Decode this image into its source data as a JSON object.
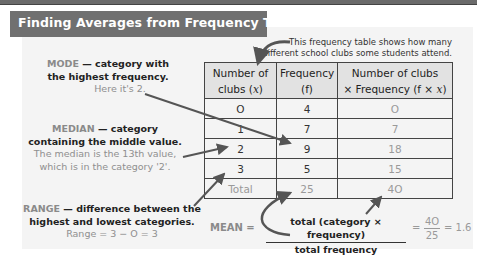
{
  "title": "Finding Averages from Frequency Tables",
  "note": {
    "line1": "This frequency table shows how many",
    "line2": "different school clubs some students attend."
  },
  "mode": {
    "keyword": "MODE",
    "definition_line1": " — category with",
    "definition_line2": "the highest frequency.",
    "example": "Here it's 2."
  },
  "median": {
    "keyword": "MEDIAN",
    "definition_line1": " — category",
    "definition_line2": "containing the middle value.",
    "example_line1": "The median is the 13th value,",
    "example_line2": "which is in the category '2'."
  },
  "range": {
    "keyword": "RANGE",
    "definition_line1": " — difference between the",
    "definition_line2": "highest and lowest categories.",
    "example": "Range = 3 − O = 3"
  },
  "table": {
    "headers": [
      {
        "line1": "Number of",
        "line2_pre": "clubs (",
        "var": "x",
        "line2_post": ")"
      },
      {
        "line1": "Frequency",
        "line2_pre": "(f)",
        "var": "",
        "line2_post": ""
      },
      {
        "line1": "Number of clubs",
        "line2_pre": "× Frequency (f × ",
        "var": "x",
        "line2_post": ")"
      }
    ],
    "rows": [
      [
        "O",
        "4",
        "O"
      ],
      [
        "1",
        "7",
        "7"
      ],
      [
        "2",
        "9",
        "18"
      ],
      [
        "3",
        "5",
        "15"
      ]
    ],
    "total_row": [
      "Total",
      "25",
      "4O"
    ]
  },
  "mean": {
    "label": "MEAN =",
    "numerator": "total (category × frequency)",
    "denominator": "total frequency",
    "eq": "=",
    "value_num": "4O",
    "value_den": "25",
    "result": "= 1.6"
  },
  "colors": {
    "title_bg": "#707070",
    "panel_bg": "#f4f4f4",
    "header_bg": "#e2e2e2",
    "keyword_grey": "#8a8a8a",
    "arrow": "#555555"
  }
}
